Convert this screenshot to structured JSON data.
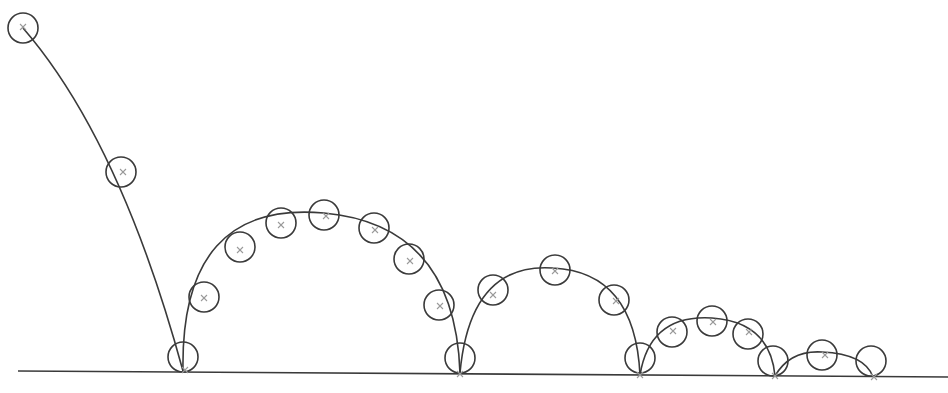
{
  "diagram": {
    "type": "bouncing-ball-trajectory",
    "colors": {
      "line": "#3a3a3a",
      "marker": "#9a9a9a",
      "background": "#ffffff"
    },
    "ground": {
      "x1": 18,
      "y1": 371,
      "x2": 948,
      "y2": 377
    },
    "ball_radius": 15,
    "trajectory_segments": [
      {
        "name": "drop",
        "path": "M23 28 Q 120 140 183 371"
      },
      {
        "name": "bounce-1",
        "path": "M183 371 Q 180 200 324 213 Q 455 225 460 373"
      },
      {
        "name": "bounce-2",
        "path": "M460 373 Q 470 262 553 268 Q 635 272 640 375"
      },
      {
        "name": "bounce-3",
        "path": "M640 375 Q 650 314 712 318 Q 770 322 775 376"
      },
      {
        "name": "bounce-4",
        "path": "M775 376 Q 790 350 822 352 Q 865 354 873 377"
      }
    ],
    "balls": [
      {
        "cx": 23,
        "cy": 28
      },
      {
        "cx": 121,
        "cy": 172
      },
      {
        "cx": 183,
        "cy": 357
      },
      {
        "cx": 204,
        "cy": 297
      },
      {
        "cx": 240,
        "cy": 247
      },
      {
        "cx": 281,
        "cy": 223
      },
      {
        "cx": 324,
        "cy": 215
      },
      {
        "cx": 374,
        "cy": 228
      },
      {
        "cx": 409,
        "cy": 259
      },
      {
        "cx": 439,
        "cy": 305
      },
      {
        "cx": 460,
        "cy": 358
      },
      {
        "cx": 493,
        "cy": 290
      },
      {
        "cx": 555,
        "cy": 270
      },
      {
        "cx": 614,
        "cy": 300
      },
      {
        "cx": 640,
        "cy": 358
      },
      {
        "cx": 672,
        "cy": 332
      },
      {
        "cx": 712,
        "cy": 321
      },
      {
        "cx": 748,
        "cy": 334
      },
      {
        "cx": 773,
        "cy": 361
      },
      {
        "cx": 822,
        "cy": 355
      },
      {
        "cx": 871,
        "cy": 361
      }
    ],
    "markers": [
      {
        "x": 23,
        "y": 27
      },
      {
        "x": 123,
        "y": 172
      },
      {
        "x": 185,
        "y": 370
      },
      {
        "x": 204,
        "y": 298
      },
      {
        "x": 240,
        "y": 250
      },
      {
        "x": 281,
        "y": 225
      },
      {
        "x": 326,
        "y": 216
      },
      {
        "x": 375,
        "y": 230
      },
      {
        "x": 410,
        "y": 261
      },
      {
        "x": 440,
        "y": 306
      },
      {
        "x": 460,
        "y": 374
      },
      {
        "x": 493,
        "y": 295
      },
      {
        "x": 555,
        "y": 271
      },
      {
        "x": 616,
        "y": 301
      },
      {
        "x": 640,
        "y": 375
      },
      {
        "x": 673,
        "y": 331
      },
      {
        "x": 713,
        "y": 322
      },
      {
        "x": 749,
        "y": 332
      },
      {
        "x": 775,
        "y": 376
      },
      {
        "x": 825,
        "y": 355
      },
      {
        "x": 874,
        "y": 377
      }
    ]
  }
}
